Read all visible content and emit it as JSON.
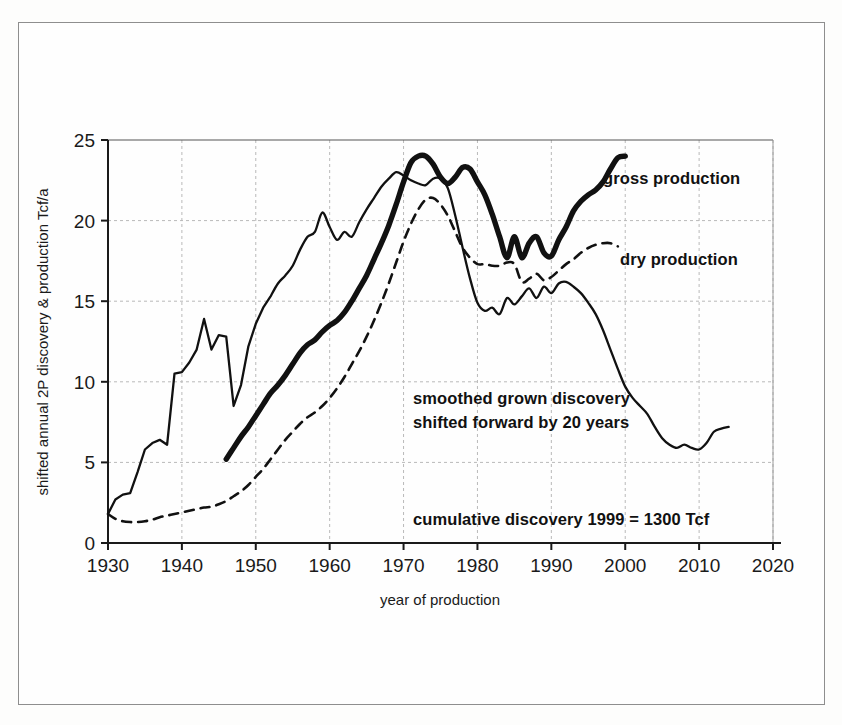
{
  "figure": {
    "background_color": "#fefefe",
    "frame_color": "#8e8e8e",
    "ink_color": "#111111",
    "grid_color": "#b9b9b9"
  },
  "axes": {
    "x_title": "year of production",
    "y_title": "shifted annual 2P discovery & production Tcf/a",
    "x_ticks": [
      "1930",
      "1940",
      "1950",
      "1960",
      "1970",
      "1980",
      "1990",
      "2000",
      "2010",
      "2020"
    ],
    "y_ticks": [
      "0",
      "5",
      "10",
      "15",
      "20",
      "25"
    ]
  },
  "annotations": {
    "gross": "gross production",
    "dry": "dry production",
    "discovery_line1": "smoothed grown discovery",
    "discovery_line2": "shifted forward by 20 years",
    "cumulative": "cumulative discovery 1999 = 1300 Tcf"
  },
  "chart_data": {
    "type": "line",
    "title": "",
    "xlabel": "year of production",
    "ylabel": "shifted annual 2P discovery & production Tcf/a",
    "xlim": [
      1930,
      2020
    ],
    "ylim": [
      0,
      25
    ],
    "xticks": [
      1930,
      1940,
      1950,
      1960,
      1970,
      1980,
      1990,
      2000,
      2010,
      2020
    ],
    "yticks": [
      0,
      5,
      10,
      15,
      20,
      25
    ],
    "grid": true,
    "legend": "inline-annotations",
    "units": "Tcf/a",
    "series": [
      {
        "name": "gross production",
        "style": "thick-solid",
        "x": [
          1946,
          1947,
          1948,
          1949,
          1950,
          1951,
          1952,
          1953,
          1954,
          1955,
          1956,
          1957,
          1958,
          1959,
          1960,
          1961,
          1962,
          1963,
          1964,
          1965,
          1966,
          1967,
          1968,
          1969,
          1970,
          1971,
          1972,
          1973,
          1974,
          1975,
          1976,
          1977,
          1978,
          1979,
          1980,
          1981,
          1982,
          1983,
          1984,
          1985,
          1986,
          1987,
          1988,
          1989,
          1990,
          1991,
          1992,
          1993,
          1994,
          1995,
          1996,
          1997,
          1998,
          1999,
          2000
        ],
        "y": [
          5.2,
          5.9,
          6.6,
          7.2,
          7.9,
          8.6,
          9.3,
          9.8,
          10.4,
          11.1,
          11.8,
          12.3,
          12.6,
          13.1,
          13.5,
          13.8,
          14.3,
          15.0,
          15.8,
          16.6,
          17.6,
          18.6,
          19.7,
          21.0,
          22.4,
          23.6,
          24.0,
          24.0,
          23.5,
          22.7,
          22.3,
          22.7,
          23.3,
          23.2,
          22.4,
          21.6,
          20.4,
          19.0,
          17.7,
          19.0,
          17.7,
          18.6,
          19.0,
          18.0,
          17.8,
          18.8,
          19.6,
          20.6,
          21.2,
          21.6,
          21.9,
          22.4,
          23.2,
          23.9,
          24.0
        ]
      },
      {
        "name": "dry production",
        "style": "dashed",
        "x": [
          1930,
          1931,
          1932,
          1933,
          1934,
          1935,
          1936,
          1937,
          1938,
          1939,
          1940,
          1941,
          1942,
          1943,
          1944,
          1945,
          1946,
          1947,
          1948,
          1949,
          1950,
          1951,
          1952,
          1953,
          1954,
          1955,
          1956,
          1957,
          1958,
          1959,
          1960,
          1961,
          1962,
          1963,
          1964,
          1965,
          1966,
          1967,
          1968,
          1969,
          1970,
          1971,
          1972,
          1973,
          1974,
          1975,
          1976,
          1977,
          1978,
          1979,
          1980,
          1981,
          1982,
          1983,
          1984,
          1985,
          1986,
          1987,
          1988,
          1989,
          1990,
          1991,
          1992,
          1993,
          1994,
          1995,
          1996,
          1997,
          1998,
          1999
        ],
        "y": [
          1.8,
          1.5,
          1.35,
          1.3,
          1.3,
          1.35,
          1.45,
          1.6,
          1.7,
          1.8,
          1.9,
          2.0,
          2.1,
          2.2,
          2.25,
          2.4,
          2.6,
          2.9,
          3.2,
          3.6,
          4.1,
          4.6,
          5.2,
          5.8,
          6.4,
          6.9,
          7.4,
          7.8,
          8.1,
          8.5,
          9.0,
          9.6,
          10.3,
          11.1,
          11.9,
          12.8,
          13.8,
          14.9,
          16.1,
          17.4,
          18.7,
          19.8,
          20.7,
          21.3,
          21.4,
          21.0,
          20.3,
          19.3,
          18.3,
          17.7,
          17.3,
          17.3,
          17.2,
          17.2,
          17.4,
          17.3,
          16.2,
          16.4,
          16.7,
          16.3,
          16.5,
          16.9,
          17.3,
          17.6,
          18.0,
          18.3,
          18.5,
          18.6,
          18.6,
          18.4
        ]
      },
      {
        "name": "smoothed grown discovery shifted forward by 20 years",
        "style": "thin-solid",
        "x": [
          1930,
          1931,
          1932,
          1933,
          1934,
          1935,
          1936,
          1937,
          1938,
          1939,
          1940,
          1941,
          1942,
          1943,
          1944,
          1945,
          1946,
          1947,
          1948,
          1949,
          1950,
          1951,
          1952,
          1953,
          1954,
          1955,
          1956,
          1957,
          1958,
          1959,
          1960,
          1961,
          1962,
          1963,
          1964,
          1965,
          1966,
          1967,
          1968,
          1969,
          1970,
          1971,
          1972,
          1973,
          1974,
          1975,
          1976,
          1977,
          1978,
          1979,
          1980,
          1981,
          1982,
          1983,
          1984,
          1985,
          1986,
          1987,
          1988,
          1989,
          1990,
          1991,
          1992,
          1993,
          1994,
          1995,
          1996,
          1997,
          1998,
          1999,
          2000,
          2001,
          2002,
          2003,
          2004,
          2005,
          2006,
          2007,
          2008,
          2009,
          2010,
          2011,
          2012,
          2013,
          2014
        ],
        "y": [
          1.8,
          2.7,
          3.0,
          3.1,
          4.4,
          5.8,
          6.2,
          6.4,
          6.1,
          10.5,
          10.6,
          11.2,
          12.0,
          13.9,
          12.0,
          12.9,
          12.8,
          8.5,
          9.8,
          12.2,
          13.6,
          14.6,
          15.3,
          16.1,
          16.6,
          17.2,
          18.2,
          19.0,
          19.3,
          20.5,
          19.6,
          18.8,
          19.3,
          19.0,
          19.9,
          20.7,
          21.4,
          22.1,
          22.6,
          23.0,
          22.8,
          22.5,
          22.3,
          22.2,
          22.6,
          22.6,
          22.0,
          20.3,
          18.3,
          16.4,
          14.9,
          14.4,
          14.6,
          14.2,
          15.2,
          14.8,
          15.3,
          15.8,
          15.2,
          15.9,
          15.5,
          16.1,
          16.2,
          15.9,
          15.5,
          14.9,
          14.2,
          13.2,
          12.0,
          10.8,
          9.7,
          9.0,
          8.5,
          8.0,
          7.2,
          6.5,
          6.1,
          5.9,
          6.1,
          5.9,
          5.8,
          6.2,
          6.9,
          7.1,
          7.2
        ]
      }
    ]
  }
}
